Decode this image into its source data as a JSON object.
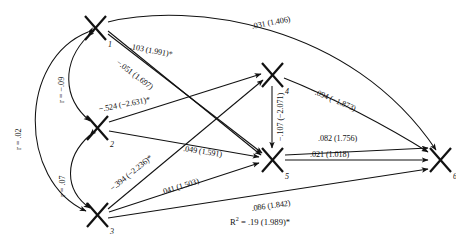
{
  "figure": {
    "type": "path-diagram",
    "nodes": [
      {
        "id": "n1",
        "label": "1",
        "glyph": "X",
        "x": 95,
        "y": 28
      },
      {
        "id": "n2",
        "label": "2",
        "glyph": "X",
        "x": 97,
        "y": 128
      },
      {
        "id": "n3",
        "label": "3",
        "glyph": "X",
        "x": 97,
        "y": 215
      },
      {
        "id": "n4",
        "label": "4",
        "glyph": "X",
        "x": 272,
        "y": 75
      },
      {
        "id": "n5",
        "label": "5",
        "glyph": "X",
        "x": 272,
        "y": 160
      },
      {
        "id": "n6",
        "label": "6",
        "glyph": "X",
        "x": 440,
        "y": 160
      }
    ],
    "correlations": [
      {
        "id": "r13",
        "text": "r = .02",
        "from": "1",
        "to": "3"
      },
      {
        "id": "r12",
        "text": "r = −.09",
        "from": "1",
        "to": "2"
      },
      {
        "id": "r23",
        "text": "r = .07",
        "from": "2",
        "to": "3"
      }
    ],
    "paths": [
      {
        "id": "p16",
        "from": "1",
        "to": "6",
        "text": ".031 (1.406)"
      },
      {
        "id": "p15",
        "from": "1",
        "to": "5",
        "text": ".103 (1.991)*"
      },
      {
        "id": "p14",
        "from": "1",
        "to": "4",
        "text": "−.051 (1.697)"
      },
      {
        "id": "p24",
        "from": "2",
        "to": "4",
        "text": "−.524 (−2.631)*"
      },
      {
        "id": "p25",
        "from": "2",
        "to": "5",
        "text": ".049 (1.591)"
      },
      {
        "id": "p34",
        "from": "3",
        "to": "4",
        "text": "−.394 (−2.236)*"
      },
      {
        "id": "p35",
        "from": "3",
        "to": "5",
        "text": ".041 (1.503)"
      },
      {
        "id": "p36",
        "from": "3",
        "to": "6",
        "text": ".086 (1.842)"
      },
      {
        "id": "p46",
        "from": "4",
        "to": "6",
        "text": "−.094 (−1.873)"
      },
      {
        "id": "p45",
        "from": "4",
        "to": "5",
        "text": "−.107 (−2.071)"
      },
      {
        "id": "p56",
        "from": "5",
        "to": "6",
        "text": ".021 (1.018)"
      },
      {
        "id": "p5a",
        "from": "5",
        "to": "6",
        "text": ".082 (1.756)"
      }
    ],
    "fit": {
      "r2_text": "R",
      "r2_sup": "2",
      "r2_value": " = .19 (1.989)*"
    },
    "colors": {
      "ink": "#111111",
      "background": "#ffffff"
    }
  }
}
